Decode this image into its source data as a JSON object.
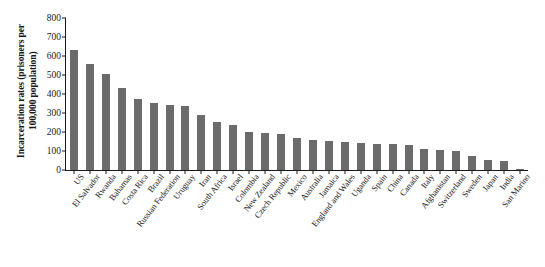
{
  "chart_data": {
    "type": "bar",
    "title": "",
    "xlabel": "",
    "ylabel": "Incarceration rates (prisoners per\n100,000 population)",
    "ylim": [
      0,
      800
    ],
    "yticks": [
      0,
      100,
      200,
      300,
      400,
      500,
      600,
      700,
      800
    ],
    "ytick_labels": [
      "0",
      "100",
      "200",
      "300",
      "400",
      "500",
      "600",
      "700",
      "800"
    ],
    "grid": false,
    "legend": null,
    "bar_color": "#6b6b6b",
    "axis_color": "#1a1a1a",
    "background_color": "#ffffff",
    "categories": [
      "US",
      "El Salvador",
      "Rwanda",
      "Bahamas",
      "Costa Rica",
      "Brazil",
      "Russian Federation",
      "Uruguay",
      "Iran",
      "South Africa",
      "Israel",
      "Colombia",
      "New Zealand",
      "Czech Republic",
      "Mexico",
      "Australia",
      "Jamaica",
      "England and Wales",
      "Uganda",
      "Spain",
      "China",
      "Canada",
      "Italy",
      "Afghanistan",
      "Switzerland",
      "Sweden",
      "Japan",
      "India",
      "San Marino"
    ],
    "values": [
      630,
      560,
      505,
      430,
      375,
      355,
      340,
      335,
      290,
      255,
      235,
      200,
      195,
      192,
      170,
      160,
      155,
      145,
      140,
      138,
      135,
      130,
      110,
      105,
      100,
      75,
      55,
      50,
      4
    ]
  }
}
